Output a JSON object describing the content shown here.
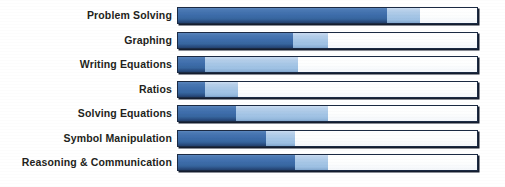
{
  "chart_data": {
    "type": "bar",
    "title": "",
    "subtitle": "",
    "xlabel": "",
    "ylabel": "",
    "xlim": [
      0,
      100
    ],
    "grid": false,
    "legend_position": "none",
    "orientation": "horizontal",
    "stacked": true,
    "categories": [
      "Problem Solving",
      "Graphing",
      "Writing Equations",
      "Ratios",
      "Solving Equations",
      "Symbol Manipulation",
      "Reasoning & Communication"
    ],
    "series": [
      {
        "name": "dark-blue-segment",
        "color": "#3a6ba8",
        "values": [
          70,
          38.5,
          9,
          9,
          19.5,
          29.5,
          39
        ]
      },
      {
        "name": "light-blue-segment",
        "color": "#a6c6e6",
        "values": [
          11,
          11.5,
          31,
          11,
          30.5,
          9.5,
          11
        ]
      },
      {
        "name": "empty-remainder",
        "color": "#ffffff",
        "values": [
          19,
          50,
          60,
          80,
          50,
          61,
          50
        ]
      }
    ],
    "cumulative_stops": [
      {
        "category": "Problem Solving",
        "dark_end": 70,
        "light_end": 81
      },
      {
        "category": "Graphing",
        "dark_end": 38.5,
        "light_end": 50
      },
      {
        "category": "Writing Equations",
        "dark_end": 9,
        "light_end": 40
      },
      {
        "category": "Ratios",
        "dark_end": 9,
        "light_end": 20
      },
      {
        "category": "Solving Equations",
        "dark_end": 19.5,
        "light_end": 50
      },
      {
        "category": "Symbol Manipulation",
        "dark_end": 29.5,
        "light_end": 39
      },
      {
        "category": "Reasoning & Communication",
        "dark_end": 39,
        "light_end": 50
      }
    ]
  },
  "colors": {
    "dark_blue": "#3a6ba8",
    "light_blue": "#a6c6e6",
    "empty": "#ffffff",
    "bar_outline": "#1b2a43",
    "bar_shadow": "#141d2e",
    "label_text": "#231f20",
    "background": "#ffffff"
  },
  "rows": [
    {
      "label": "Problem Solving",
      "dark_end": 70,
      "light_end": 81
    },
    {
      "label": "Graphing",
      "dark_end": 38.5,
      "light_end": 50
    },
    {
      "label": "Writing Equations",
      "dark_end": 9,
      "light_end": 40
    },
    {
      "label": "Ratios",
      "dark_end": 9,
      "light_end": 20
    },
    {
      "label": "Solving Equations",
      "dark_end": 19.5,
      "light_end": 50
    },
    {
      "label": "Symbol Manipulation",
      "dark_end": 29.5,
      "light_end": 39
    },
    {
      "label": "Reasoning & Communication",
      "dark_end": 39,
      "light_end": 50
    }
  ]
}
